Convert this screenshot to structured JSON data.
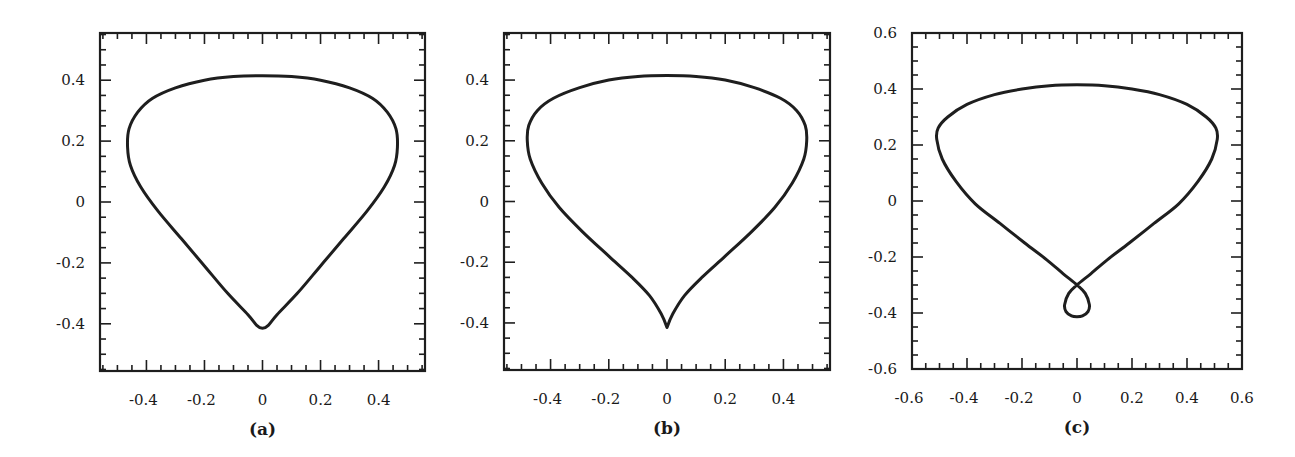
{
  "chart_data": [
    {
      "type": "line",
      "panel": "a",
      "caption": "(a)",
      "title": "",
      "xlabel": "",
      "ylabel": "",
      "xlim": [
        -0.56,
        0.56
      ],
      "ylim": [
        -0.555,
        0.555
      ],
      "grid": false,
      "legend": null,
      "xticks": [
        -0.4,
        -0.2,
        0,
        0.2,
        0.4
      ],
      "xtick_labels": [
        "-0.4",
        "-0.2",
        "0",
        "0.2",
        "0.4"
      ],
      "yticks": [
        -0.4,
        -0.2,
        0,
        0.2,
        0.4
      ],
      "ytick_labels": [
        "-0.4",
        "-0.2",
        "0",
        "0.2",
        "0.4"
      ],
      "minor_tick_step": 0.05,
      "frame_px": {
        "left": 100,
        "right": 425,
        "top": 33,
        "bottom": 371
      },
      "description": "Closed rounded teardrop curve with smooth bottom",
      "series": [
        {
          "name": "curve",
          "closed": true,
          "x": [
            0.0,
            0.1,
            0.2,
            0.3,
            0.38,
            0.43,
            0.46,
            0.465,
            0.455,
            0.42,
            0.36,
            0.28,
            0.2,
            0.12,
            0.05,
            0.02,
            0.0,
            -0.02,
            -0.05,
            -0.12,
            -0.2,
            -0.28,
            -0.36,
            -0.42,
            -0.455,
            -0.465,
            -0.46,
            -0.43,
            -0.38,
            -0.3,
            -0.2,
            -0.1
          ],
          "y": [
            0.415,
            0.412,
            0.4,
            0.375,
            0.34,
            0.295,
            0.24,
            0.18,
            0.12,
            0.05,
            -0.03,
            -0.12,
            -0.21,
            -0.3,
            -0.37,
            -0.405,
            -0.415,
            -0.405,
            -0.37,
            -0.3,
            -0.21,
            -0.12,
            -0.03,
            0.05,
            0.12,
            0.18,
            0.24,
            0.295,
            0.34,
            0.375,
            0.4,
            0.412
          ]
        }
      ]
    },
    {
      "type": "line",
      "panel": "b",
      "caption": "(b)",
      "title": "",
      "xlabel": "",
      "ylabel": "",
      "xlim": [
        -0.56,
        0.56
      ],
      "ylim": [
        -0.555,
        0.555
      ],
      "grid": false,
      "legend": null,
      "xticks": [
        -0.4,
        -0.2,
        0,
        0.2,
        0.4
      ],
      "xtick_labels": [
        "-0.4",
        "-0.2",
        "0",
        "0.2",
        "0.4"
      ],
      "yticks": [
        -0.4,
        -0.2,
        0,
        0.2,
        0.4
      ],
      "ytick_labels": [
        "-0.4",
        "-0.2",
        "0",
        "0.2",
        "0.4"
      ],
      "minor_tick_step": 0.05,
      "frame_px": {
        "left": 504,
        "right": 830,
        "top": 33,
        "bottom": 370
      },
      "description": "Closed teardrop curve with sharp cusp at bottom",
      "series": [
        {
          "name": "curve",
          "closed": true,
          "x": [
            0.0,
            0.1,
            0.2,
            0.3,
            0.39,
            0.445,
            0.475,
            0.48,
            0.47,
            0.43,
            0.37,
            0.29,
            0.2,
            0.12,
            0.06,
            0.02,
            0.0,
            -0.02,
            -0.06,
            -0.12,
            -0.2,
            -0.29,
            -0.37,
            -0.43,
            -0.47,
            -0.48,
            -0.475,
            -0.445,
            -0.39,
            -0.3,
            -0.2,
            -0.1
          ],
          "y": [
            0.415,
            0.412,
            0.4,
            0.375,
            0.34,
            0.3,
            0.25,
            0.2,
            0.14,
            0.06,
            -0.02,
            -0.1,
            -0.18,
            -0.25,
            -0.31,
            -0.37,
            -0.415,
            -0.37,
            -0.31,
            -0.25,
            -0.18,
            -0.1,
            -0.02,
            0.06,
            0.14,
            0.2,
            0.25,
            0.3,
            0.34,
            0.375,
            0.4,
            0.412
          ]
        }
      ]
    },
    {
      "type": "line",
      "panel": "c",
      "caption": "(c)",
      "title": "",
      "xlabel": "",
      "ylabel": "",
      "xlim": [
        -0.6,
        0.6
      ],
      "ylim": [
        -0.6,
        0.6
      ],
      "grid": false,
      "legend": null,
      "xticks": [
        -0.6,
        -0.4,
        -0.2,
        0,
        0.2,
        0.4,
        0.6
      ],
      "xtick_labels": [
        "-0.6",
        "-0.4",
        "-0.2",
        "0",
        "0.2",
        "0.4",
        "0.6"
      ],
      "yticks": [
        -0.6,
        -0.4,
        -0.2,
        0,
        0.2,
        0.4,
        0.6
      ],
      "ytick_labels": [
        "-0.6",
        "-0.4",
        "-0.2",
        "0",
        "0.2",
        "0.4",
        "0.6"
      ],
      "minor_tick_step": 0.05,
      "frame_px": {
        "left": 912,
        "right": 1242,
        "top": 33,
        "bottom": 369
      },
      "description": "Closed teardrop curve self-intersecting near (0,-0.3) forming a small loop at the bottom",
      "series": [
        {
          "name": "curve",
          "closed": true,
          "x": [
            0.0,
            0.1,
            0.2,
            0.3,
            0.4,
            0.47,
            0.505,
            0.51,
            0.49,
            0.44,
            0.37,
            0.28,
            0.19,
            0.11,
            0.05,
            0.0,
            -0.03,
            -0.045,
            -0.04,
            -0.02,
            0.0,
            0.02,
            0.04,
            0.045,
            0.03,
            0.0,
            -0.05,
            -0.11,
            -0.19,
            -0.28,
            -0.37,
            -0.44,
            -0.49,
            -0.51,
            -0.505,
            -0.47,
            -0.4,
            -0.3,
            -0.2,
            -0.1
          ],
          "y": [
            0.415,
            0.412,
            0.4,
            0.38,
            0.345,
            0.3,
            0.26,
            0.22,
            0.15,
            0.07,
            -0.01,
            -0.08,
            -0.15,
            -0.21,
            -0.26,
            -0.3,
            -0.33,
            -0.37,
            -0.395,
            -0.41,
            -0.413,
            -0.41,
            -0.395,
            -0.37,
            -0.33,
            -0.3,
            -0.26,
            -0.21,
            -0.15,
            -0.08,
            -0.01,
            0.07,
            0.15,
            0.22,
            0.26,
            0.3,
            0.345,
            0.38,
            0.4,
            0.412
          ]
        }
      ]
    }
  ],
  "panels": {
    "a": {
      "caption": "(a)"
    },
    "b": {
      "caption": "(b)"
    },
    "c": {
      "caption": "(c)"
    }
  },
  "style": {
    "line_color": "#1e1e1e",
    "frame_color": "#1e1e1e",
    "background": "#ffffff"
  }
}
